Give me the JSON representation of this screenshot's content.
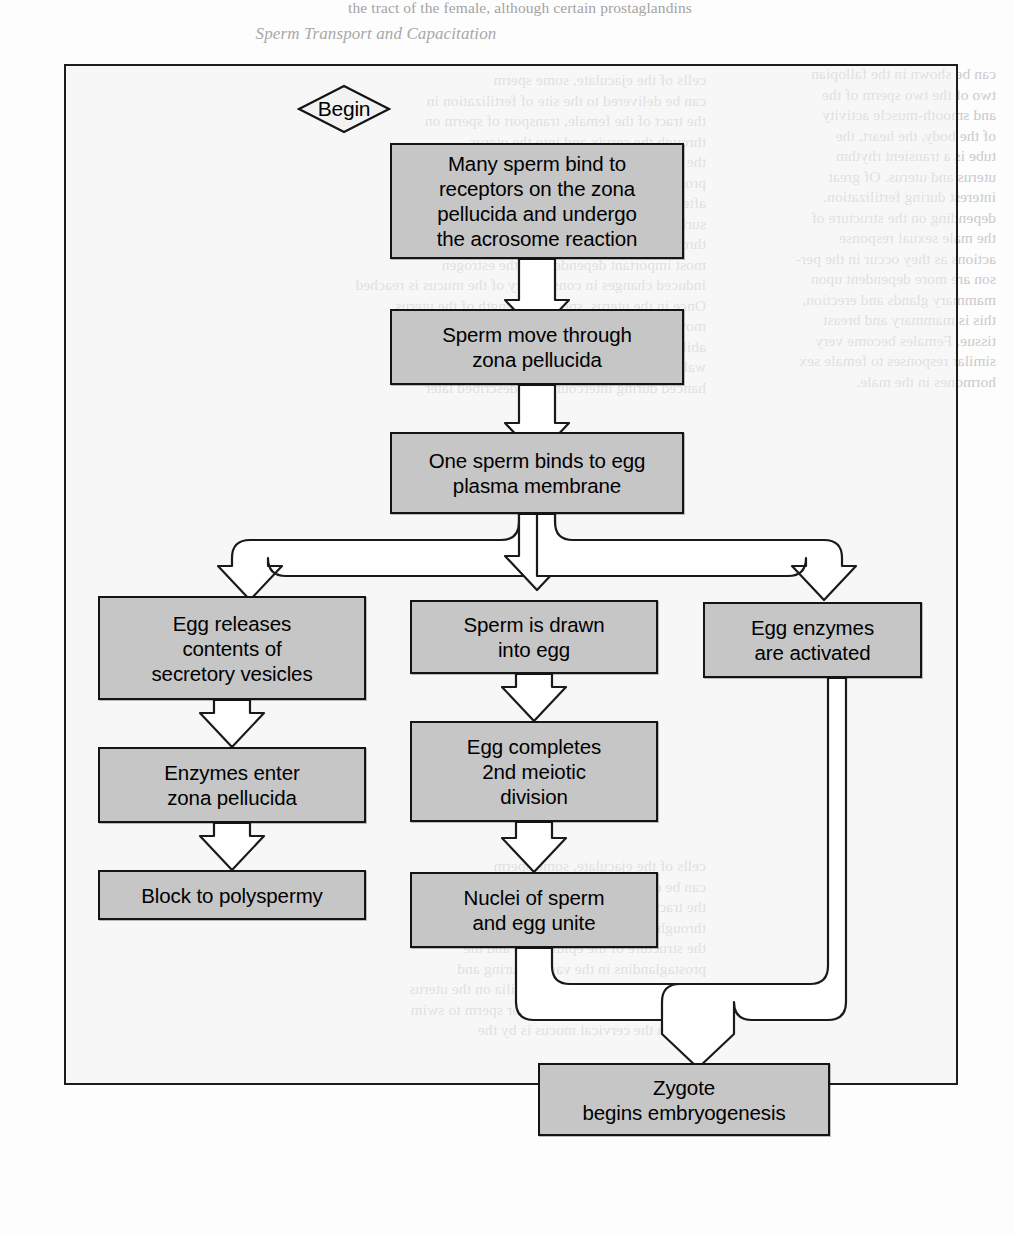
{
  "figure": {
    "frame": {
      "x": 64,
      "y": 64,
      "w": 894,
      "h": 1021
    },
    "box_fill": "#c6c6c6",
    "box_stroke": "#141414",
    "connector_fill": "#ffffff",
    "connector_stroke": "#1a1a1a"
  },
  "start": {
    "label": "Begin",
    "shape": "diamond"
  },
  "nodes": [
    {
      "id": "bind-receptors",
      "lines": [
        "Many sperm bind to",
        "receptors on the zona",
        "pellucida and undergo",
        "the acrosome reaction"
      ],
      "x": 390,
      "y": 143,
      "w": 294,
      "h": 116
    },
    {
      "id": "move-through-zona",
      "lines": [
        "Sperm move through",
        "zona pellucida"
      ],
      "x": 390,
      "y": 309,
      "w": 294,
      "h": 76
    },
    {
      "id": "bind-plasma-membrane",
      "lines": [
        "One sperm binds to egg",
        "plasma membrane"
      ],
      "x": 390,
      "y": 432,
      "w": 294,
      "h": 82
    },
    {
      "id": "egg-releases-vesicles",
      "lines": [
        "Egg releases",
        "contents of",
        "secretory vesicles"
      ],
      "x": 98,
      "y": 596,
      "w": 268,
      "h": 104
    },
    {
      "id": "sperm-drawn-into-egg",
      "lines": [
        "Sperm is drawn",
        "into egg"
      ],
      "x": 410,
      "y": 600,
      "w": 248,
      "h": 74
    },
    {
      "id": "egg-enzymes-activated",
      "lines": [
        "Egg enzymes",
        "are activated"
      ],
      "x": 703,
      "y": 602,
      "w": 219,
      "h": 76
    },
    {
      "id": "enzymes-enter-zona",
      "lines": [
        "Enzymes enter",
        "zona pellucida"
      ],
      "x": 98,
      "y": 747,
      "w": 268,
      "h": 76
    },
    {
      "id": "egg-completes-meiosis",
      "lines": [
        "Egg completes",
        "2nd meiotic",
        "division"
      ],
      "x": 410,
      "y": 721,
      "w": 248,
      "h": 101
    },
    {
      "id": "block-to-polyspermy",
      "lines": [
        "Block to polyspermy"
      ],
      "x": 98,
      "y": 870,
      "w": 268,
      "h": 50
    },
    {
      "id": "nuclei-unite",
      "lines": [
        "Nuclei of sperm",
        "and egg unite"
      ],
      "x": 410,
      "y": 872,
      "w": 248,
      "h": 76
    },
    {
      "id": "zygote-embryogenesis",
      "lines": [
        "Zygote",
        "begins embryogenesis"
      ],
      "x": 538,
      "y": 1063,
      "w": 292,
      "h": 73
    }
  ],
  "connectors": [
    {
      "id": "bind-to-move",
      "from": "bind-receptors",
      "to": "move-through-zona",
      "kind": "down-arrow"
    },
    {
      "id": "move-to-plasma",
      "from": "move-through-zona",
      "to": "bind-plasma-membrane",
      "kind": "down-arrow"
    },
    {
      "id": "plasma-split-left",
      "from": "bind-plasma-membrane",
      "to": "egg-releases-vesicles",
      "kind": "branch-left"
    },
    {
      "id": "plasma-split-center",
      "from": "bind-plasma-membrane",
      "to": "sperm-drawn-into-egg",
      "kind": "branch-down"
    },
    {
      "id": "plasma-split-right",
      "from": "bind-plasma-membrane",
      "to": "egg-enzymes-activated",
      "kind": "branch-right"
    },
    {
      "id": "vesicles-to-enzymes",
      "from": "egg-releases-vesicles",
      "to": "enzymes-enter-zona",
      "kind": "down-arrow"
    },
    {
      "id": "enzymes-to-block",
      "from": "enzymes-enter-zona",
      "to": "block-to-polyspermy",
      "kind": "down-arrow"
    },
    {
      "id": "drawn-to-meiosis",
      "from": "sperm-drawn-into-egg",
      "to": "egg-completes-meiosis",
      "kind": "down-arrow"
    },
    {
      "id": "meiosis-to-nuclei",
      "from": "egg-completes-meiosis",
      "to": "nuclei-unite",
      "kind": "down-arrow"
    },
    {
      "id": "nuclei-to-zygote",
      "from": "nuclei-unite",
      "to": "zygote-embryogenesis",
      "kind": "merge-from-left"
    },
    {
      "id": "enzymes-activated-to-zygote",
      "from": "egg-enzymes-activated",
      "to": "zygote-embryogenesis",
      "kind": "merge-from-right"
    }
  ],
  "page_bleed": {
    "top_line": "the tract of the female, although certain prostaglandins",
    "column_heading": "Sperm Transport and Capacitation",
    "left_column": [
      "cells of the ejaculate, some sperm",
      "can be delivered to the site of fertilization in",
      "the tract of the female, transport of sperm on",
      "through the cervix and into the uterus",
      "the structure of the epididymis and the",
      "prostaglandins in the vagina during and",
      "after intercourse. Relying on cilia on the uterus",
      "surface of the fallopian tube for sperm to swim",
      "through the cervical mucus is by the",
      "most important dependent on the estrogen",
      "induced changes in consistency of the mucus is reached",
      "Once in the uterus, sperm the length of the uterus",
      "move primarily by the sperm's own swimming",
      "ability, the contribution of the uterine",
      "wall, and by contractions which are greatly en-",
      "hanced during intercourse, as described later"
    ],
    "right_column": [
      "can be shown in the fallopian",
      "two of the two sperm of the",
      "and smooth-muscle activity",
      "of the body, the heart, the",
      "tube is a transient rhythm",
      "uterus and uterus. Of great",
      "interest during fertilization.",
      "depending on the structure of",
      "the male sexual response",
      "actions as they occur in the per-",
      "son are more dependent upon",
      "mammary glands and erection,",
      "this is mammary and breast",
      "tissue. Females become very",
      "similar responses to female sex",
      "hormones in the male."
    ]
  }
}
